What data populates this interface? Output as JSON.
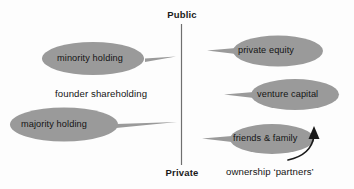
{
  "diagram": {
    "title_axis": {
      "top_label": "Public",
      "bottom_label": "Private"
    },
    "plain_labels": {
      "founder_shareholding": "founder shareholding",
      "ownership_partners": "ownership ‘partners’"
    },
    "blobs": [
      {
        "id": "minority-holding",
        "label": "minority holding",
        "side": "left"
      },
      {
        "id": "majority-holding",
        "label": "majority holding",
        "side": "left"
      },
      {
        "id": "private-equity",
        "label": "private equity",
        "side": "right"
      },
      {
        "id": "venture-capital",
        "label": "venture capital",
        "side": "right"
      },
      {
        "id": "friends-family",
        "label": "friends & family",
        "side": "right"
      }
    ],
    "colors": {
      "background": "#fdfdfd",
      "blob_fill": "#9a9a9a",
      "text": "#141414",
      "axis_line": "#6f6f6f",
      "arrow": "#1a1a1a"
    }
  }
}
